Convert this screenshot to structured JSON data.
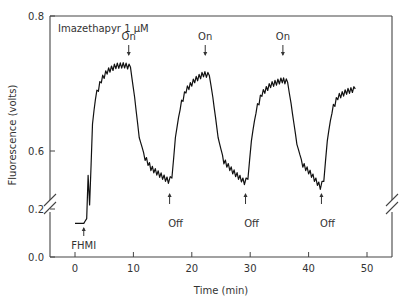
{
  "chart_data": {
    "type": "line",
    "title": "",
    "annotation_title": "Imazethapyr 1 µM",
    "xlabel": "Time (min)",
    "ylabel": "Fluorescence (volts)",
    "x_ticks": [
      0,
      10,
      20,
      30,
      40,
      50
    ],
    "y_ticks": [
      "0.0",
      "0.2",
      "0.6",
      "0.8"
    ],
    "xlim": [
      -4,
      54
    ],
    "ylim": [
      0.0,
      0.8
    ],
    "y_axis_break": "between 0.2 and 0.6",
    "grid": false,
    "legend": null,
    "annotations": [
      {
        "text": "FHMI",
        "x": 1.5,
        "arrow": "up"
      },
      {
        "text": "On",
        "x": 9.2,
        "arrow": "down"
      },
      {
        "text": "Off",
        "x": 16.2,
        "arrow": "up"
      },
      {
        "text": "On",
        "x": 22.3,
        "arrow": "down"
      },
      {
        "text": "Off",
        "x": 29.2,
        "arrow": "up"
      },
      {
        "text": "On",
        "x": 35.6,
        "arrow": "down"
      },
      {
        "text": "Off",
        "x": 42.2,
        "arrow": "up"
      }
    ],
    "series": [
      {
        "name": "Fluorescence",
        "x": [
          0,
          1.5,
          2.0,
          2.5,
          3.0,
          3.5,
          4.5,
          5.5,
          7.0,
          8.5,
          9.5,
          10.2,
          11.0,
          12.0,
          13.0,
          14.5,
          16.0,
          16.6,
          17.2,
          18.0,
          19.0,
          20.5,
          22.0,
          23.0,
          23.6,
          24.5,
          25.5,
          27.0,
          29.0,
          29.6,
          30.2,
          31.0,
          32.0,
          33.5,
          35.5,
          36.4,
          37.0,
          38.0,
          39.0,
          40.5,
          42.0,
          42.6,
          43.2,
          44.0,
          45.0,
          46.5,
          48.0
        ],
        "y": [
          0.14,
          0.14,
          0.16,
          0.52,
          0.64,
          0.68,
          0.705,
          0.718,
          0.726,
          0.727,
          0.724,
          0.68,
          0.62,
          0.59,
          0.575,
          0.565,
          0.556,
          0.56,
          0.62,
          0.665,
          0.69,
          0.705,
          0.714,
          0.712,
          0.68,
          0.62,
          0.585,
          0.57,
          0.554,
          0.558,
          0.615,
          0.66,
          0.685,
          0.698,
          0.705,
          0.702,
          0.67,
          0.61,
          0.58,
          0.565,
          0.547,
          0.555,
          0.615,
          0.66,
          0.68,
          0.688,
          0.692
        ]
      }
    ]
  }
}
